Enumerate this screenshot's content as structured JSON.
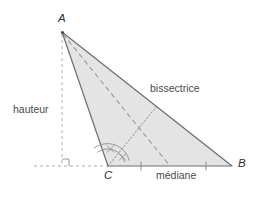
{
  "figure": {
    "vertices": {
      "A": {
        "label": "A",
        "x": 62,
        "y": 32
      },
      "B": {
        "label": "B",
        "x": 232,
        "y": 166
      },
      "C": {
        "label": "C",
        "x": 108,
        "y": 166
      }
    },
    "annotations": {
      "hauteur": "hauteur",
      "bissectrice": "bissectrice",
      "mediane": "médiane"
    },
    "colors": {
      "fill": "#e4e4e4",
      "outline": "#6e6e6e",
      "dash": "#9a9a9a",
      "dot": "#a6a6a6",
      "text": "#3b3b3b",
      "background": "#ffffff"
    },
    "segments": {
      "altitude": {
        "name": "hauteur",
        "style": "dashed",
        "from": [
          62,
          32
        ],
        "to": [
          62,
          166
        ],
        "vertical": true
      },
      "baseline": {
        "name": "extended-base",
        "style": "dashed",
        "from": [
          34,
          166
        ],
        "to": [
          108,
          166
        ]
      },
      "bisector": {
        "name": "bissectrice",
        "style": "dotted",
        "from": [
          108,
          166
        ],
        "to": [
          155,
          108
        ]
      },
      "median": {
        "name": "médiane",
        "style": "dashed",
        "from": [
          62,
          32
        ],
        "to": [
          170,
          166
        ]
      }
    },
    "marks": {
      "right_angle": {
        "at": [
          62,
          166
        ],
        "size": 7
      },
      "angle_arcs": {
        "at": [
          108,
          166
        ],
        "count": 2,
        "tick": true
      },
      "equal_ticks": [
        [
          141,
          166
        ],
        [
          206,
          166
        ]
      ]
    }
  }
}
